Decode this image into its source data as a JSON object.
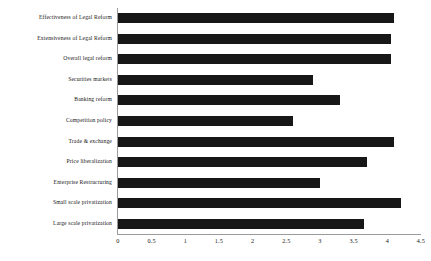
{
  "chart_data": {
    "type": "bar",
    "orientation": "horizontal",
    "title": "",
    "subtitle": "",
    "xlabel": "",
    "ylabel": "",
    "xlim": [
      0,
      4.5
    ],
    "xticks": [
      "0",
      "0.5",
      "1",
      "1.5",
      "2",
      "2.5",
      "3",
      "3.5",
      "4",
      "4.5"
    ],
    "xtick_values": [
      0,
      0.5,
      1,
      1.5,
      2,
      2.5,
      3,
      3.5,
      4,
      4.5
    ],
    "grid": false,
    "legend": null,
    "bar_color": "#171717",
    "axis_color": "#9a9a9a",
    "categories": [
      "Effectiveness of Legal Reform",
      "Extensiveness of Legal Reform",
      "Overall legal reform",
      "Securities markets",
      "Banking reform",
      "Competition policy",
      "Trade & exchange",
      "Price liberalization",
      "Enterprise Restructuring",
      "Small scale privatization",
      "Large scale privatization"
    ],
    "values": [
      4.1,
      4.05,
      4.05,
      2.9,
      3.3,
      2.6,
      4.1,
      3.7,
      3.0,
      4.2,
      3.65
    ]
  }
}
